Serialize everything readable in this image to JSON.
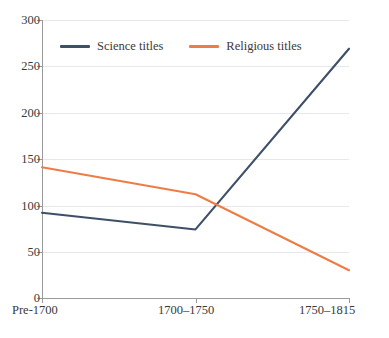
{
  "chart_data": {
    "type": "line",
    "title": "",
    "subtitle": "",
    "xlabel": "",
    "ylabel": "",
    "categories": [
      "Pre-1700",
      "1700–1750",
      "1750–1815"
    ],
    "ylim": [
      0,
      300
    ],
    "yticks": [
      0,
      50,
      100,
      150,
      200,
      250,
      300
    ],
    "ytick_labels": [
      "0",
      "50",
      "100",
      "150",
      "200",
      "250",
      "300"
    ],
    "grid": true,
    "legend_position": "top-inside",
    "series": [
      {
        "name": "Science titles",
        "color": "#3D5068",
        "values": [
          92,
          74,
          269
        ]
      },
      {
        "name": "Religious titles",
        "color": "#ED7D45",
        "values": [
          141,
          112,
          30
        ]
      }
    ]
  },
  "legend": {
    "items": [
      {
        "label": "Science titles",
        "color": "#3D5068"
      },
      {
        "label": "Religious titles",
        "color": "#ED7D45"
      }
    ]
  },
  "axes": {
    "y_tick_labels": [
      "300",
      "250",
      "200",
      "150",
      "100",
      "50",
      "0"
    ],
    "x_tick_labels": [
      "Pre-1700",
      "1700–1750",
      "1750–1815"
    ]
  },
  "colors": {
    "science": "#3D5068",
    "religious": "#ED7D45",
    "grid": "#e8e8ec",
    "axis": "#9a9a9a",
    "text": "#3a3a3a",
    "background": "#ffffff"
  }
}
